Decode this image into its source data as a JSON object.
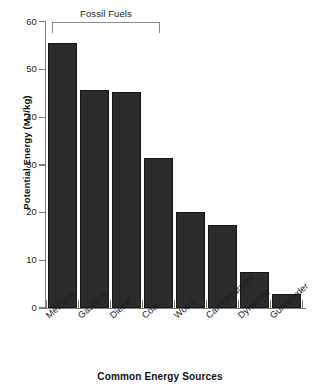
{
  "chart_data": {
    "type": "bar",
    "title": "",
    "xlabel": "Common Energy Sources",
    "ylabel": "Potential Energy (MJ/kg)",
    "ylim": [
      0,
      60
    ],
    "yticks": [
      0,
      10,
      20,
      30,
      40,
      50,
      60
    ],
    "ytick_labels": [
      "0",
      "10",
      "20",
      "30",
      "40",
      "50",
      "60"
    ],
    "grid": false,
    "legend": "none",
    "bar_color": "#2b2b2b",
    "categories": [
      "Methane",
      "Gasoline",
      "Diesel",
      "Coal",
      "Wood",
      "Carbohydrates",
      "Dynamite",
      "Gunpowder"
    ],
    "values": [
      55.5,
      45.8,
      45.4,
      31.5,
      20.2,
      17.5,
      7.5,
      3.0
    ],
    "annotations": [
      {
        "label": "Fossil Fuels",
        "type": "bracket",
        "spans": [
          "Methane",
          "Gasoline",
          "Diesel",
          "Coal"
        ]
      }
    ]
  }
}
